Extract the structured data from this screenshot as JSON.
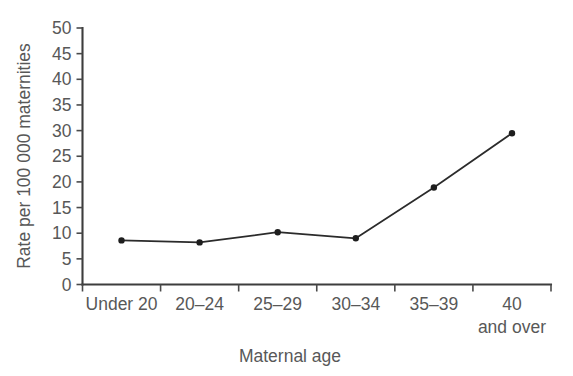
{
  "chart_data": {
    "type": "line",
    "title": "",
    "xlabel": "Maternal age",
    "ylabel": "Rate per 100 000 maternities",
    "categories": [
      "Under 20",
      "20–24",
      "25–29",
      "30–34",
      "35–39",
      "40 and over"
    ],
    "category_lines": [
      [
        "Under 20"
      ],
      [
        "20–24"
      ],
      [
        "25–29"
      ],
      [
        "30–34"
      ],
      [
        "35–39"
      ],
      [
        "40",
        "and over"
      ]
    ],
    "values": [
      8.6,
      8.2,
      10.2,
      9.0,
      18.9,
      29.5
    ],
    "ylim": [
      0,
      50
    ],
    "ytick_step": 5,
    "yticks": [
      "0",
      "5",
      "10",
      "15",
      "20",
      "25",
      "30",
      "35",
      "40",
      "45",
      "50"
    ],
    "grid": false,
    "legend": "none",
    "marker": "dot",
    "line_color": "#2b2b2b",
    "marker_color": "#1e1e1e",
    "axis_color": "#3d3d3d",
    "text_color": "#585858",
    "background": "#ffffff"
  }
}
